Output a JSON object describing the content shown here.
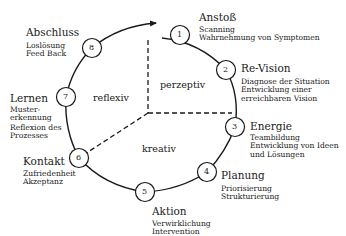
{
  "diagram": {
    "zones": [
      {
        "id": "perzeptiv",
        "label": "perzeptiv"
      },
      {
        "id": "reflexiv",
        "label": "reflexiv"
      },
      {
        "id": "kreativ",
        "label": "kreativ"
      }
    ],
    "steps": [
      {
        "number": "1",
        "title": "Anstoß",
        "lines": [
          "Scanning",
          "Wahrnehmung von Symptomen"
        ]
      },
      {
        "number": "2",
        "title": "Re-Vision",
        "lines": [
          "Diagnose der Situation",
          "Entwicklung einer",
          "erreichbaren Vision"
        ]
      },
      {
        "number": "3",
        "title": "Energie",
        "lines": [
          "Teambildung",
          "Entwicklung von Ideen",
          "und Lösungen"
        ]
      },
      {
        "number": "4",
        "title": "Planung",
        "lines": [
          "Priorisierung",
          "Strukturierung"
        ]
      },
      {
        "number": "5",
        "title": "Aktion",
        "lines": [
          "Verwirklichung",
          "Intervention"
        ]
      },
      {
        "number": "6",
        "title": "Kontakt",
        "lines": [
          "Zufriedenheit",
          "Akzeptanz"
        ]
      },
      {
        "number": "7",
        "title": "Lernen",
        "lines": [
          "Muster-",
          "erkennung",
          "Reflexion des",
          "Prozesses"
        ]
      },
      {
        "number": "8",
        "title": "Abschluss",
        "lines": [
          "Loslösung",
          "Feed Back"
        ]
      }
    ]
  }
}
